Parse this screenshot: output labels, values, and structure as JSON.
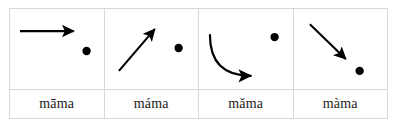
{
  "figure": {
    "type": "tone-contour-table",
    "columns": 4,
    "rows": 2,
    "background_color": "#ffffff",
    "border_color": "#d8d8d8",
    "ink_color": "#000000",
    "text_color": "#222222"
  },
  "cells": [
    {
      "id": "tone-1",
      "label": "māma",
      "contour_name": "level-arrow",
      "dot_label": "tone-dot",
      "arrow_path": "M 10,22 L 64,22",
      "dot_cx": 77,
      "dot_cy": 42,
      "dot_r": 4.2
    },
    {
      "id": "tone-2",
      "label": "máma",
      "contour_name": "rising-arrow",
      "dot_label": "tone-dot",
      "arrow_path": "M 14,62 L 50,20",
      "dot_cx": 74,
      "dot_cy": 39,
      "dot_r": 4.2
    },
    {
      "id": "tone-3",
      "label": "mǎma",
      "contour_name": "dipping-curved-arrow",
      "dot_label": "tone-dot",
      "arrow_path": "M 11,26 C 11,56 28,67 52,67",
      "dot_cx": 76,
      "dot_cy": 28,
      "dot_r": 4.2
    },
    {
      "id": "tone-4",
      "label": "màma",
      "contour_name": "falling-arrow",
      "dot_label": "tone-dot",
      "arrow_path": "M 16,15 L 52,50",
      "dot_cx": 66,
      "dot_cy": 62,
      "dot_r": 4.2
    }
  ]
}
